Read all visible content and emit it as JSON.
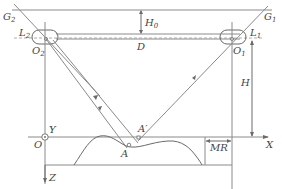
{
  "diagram": {
    "type": "geometric-schematic",
    "labels": {
      "g2": "G",
      "g2_sub": "2",
      "g1": "G",
      "g1_sub": "1",
      "l2": "L",
      "l2_sub": "2",
      "l1": "L",
      "l1_sub": "1",
      "o2": "O",
      "o2_sub": "2",
      "o1": "O",
      "o1_sub": "1",
      "d": "D",
      "h0": "H",
      "h0_sub": "0",
      "h": "H",
      "y": "Y",
      "o": "O",
      "a": "A",
      "a_prime": "A′",
      "mr": "MR",
      "x": "X",
      "z": "Z"
    },
    "colors": {
      "line": "#8a8a8a",
      "text": "#444444"
    }
  }
}
